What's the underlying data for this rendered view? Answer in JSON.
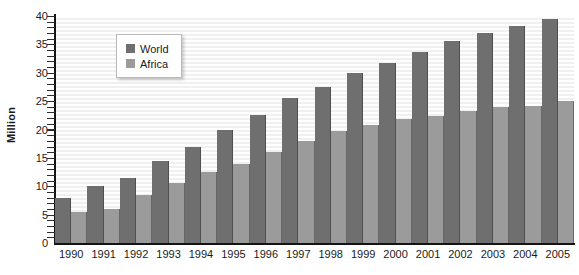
{
  "chart_data": {
    "type": "bar",
    "title": "",
    "xlabel": "",
    "ylabel": "Million",
    "ylim": [
      0,
      40
    ],
    "ytick_step": 5,
    "yticks": [
      40,
      35,
      30,
      25,
      20,
      15,
      10,
      5,
      0
    ],
    "grid": true,
    "grid_orientation": "horizontal",
    "legend_position": "top-left-inside",
    "categories": [
      "1990",
      "1991",
      "1992",
      "1993",
      "1994",
      "1995",
      "1996",
      "1997",
      "1998",
      "1999",
      "2000",
      "2001",
      "2002",
      "2003",
      "2004",
      "2005"
    ],
    "series": [
      {
        "name": "World",
        "color": "#6f6f6f",
        "values": [
          8,
          10,
          11.5,
          14.5,
          17,
          20,
          22.5,
          25.5,
          27.5,
          30,
          31.8,
          33.7,
          35.6,
          37,
          38.2,
          39.5
        ]
      },
      {
        "name": "Africa",
        "color": "#9b9b9b",
        "values": [
          5.5,
          6,
          8.5,
          10.5,
          12.5,
          14,
          16,
          18,
          19.8,
          20.8,
          21.8,
          22.3,
          23.3,
          24,
          24.2,
          25
        ]
      }
    ]
  },
  "axes": {
    "y_title": "Million"
  },
  "colors": {
    "world": "#6f6f6f",
    "africa": "#9b9b9b",
    "axis": "#141414",
    "gridline": "#f0f0f0",
    "background": "#ffffff"
  }
}
